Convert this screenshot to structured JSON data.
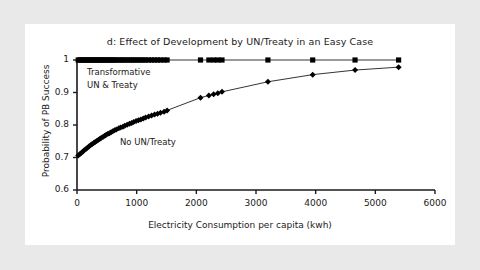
{
  "figure": {
    "background_color": "#e9e9e9",
    "panel_color": "#ffffff",
    "ink_color": "#1a1a1a"
  },
  "chart_data": {
    "type": "line",
    "title": "d: Effect of Development by UN/Treaty in an Easy Case",
    "xlabel": "Electricity Consumption per capita (kwh)",
    "ylabel": "Probability of PB Success",
    "xlim": [
      0,
      6000
    ],
    "ylim": [
      0.6,
      1.0
    ],
    "xticks": [
      0,
      1000,
      2000,
      3000,
      4000,
      5000,
      6000
    ],
    "xtick_labels": [
      "0",
      "1000",
      "2000",
      "3000",
      "4000",
      "5000",
      "6000"
    ],
    "yticks": [
      0.6,
      0.7,
      0.8,
      0.9,
      1.0
    ],
    "ytick_labels": [
      "0.6",
      "0.7",
      "0.8",
      "0.9",
      "1"
    ],
    "grid": false,
    "legend_position": "inline-annotations",
    "annotations": [
      {
        "text": "Transformative",
        "x": 260,
        "y": 0.955
      },
      {
        "text": "UN & Treaty",
        "x": 260,
        "y": 0.915
      },
      {
        "text": "No UN/Treaty",
        "x": 1430,
        "y": 0.735
      }
    ],
    "series": [
      {
        "name": "Transformative UN & Treaty",
        "marker": "square",
        "color": "#000000",
        "points": [
          [
            20,
            1.0
          ],
          [
            45,
            1.0
          ],
          [
            70,
            1.0
          ],
          [
            95,
            1.0
          ],
          [
            120,
            1.0
          ],
          [
            150,
            1.0
          ],
          [
            175,
            1.0
          ],
          [
            200,
            1.0
          ],
          [
            225,
            1.0
          ],
          [
            250,
            1.0
          ],
          [
            280,
            1.0
          ],
          [
            305,
            1.0
          ],
          [
            330,
            1.0
          ],
          [
            360,
            1.0
          ],
          [
            385,
            1.0
          ],
          [
            410,
            1.0
          ],
          [
            440,
            1.0
          ],
          [
            465,
            1.0
          ],
          [
            490,
            1.0
          ],
          [
            520,
            1.0
          ],
          [
            545,
            1.0
          ],
          [
            570,
            1.0
          ],
          [
            600,
            1.0
          ],
          [
            630,
            1.0
          ],
          [
            660,
            1.0
          ],
          [
            700,
            1.0
          ],
          [
            730,
            1.0
          ],
          [
            770,
            1.0
          ],
          [
            800,
            1.0
          ],
          [
            840,
            1.0
          ],
          [
            880,
            1.0
          ],
          [
            915,
            1.0
          ],
          [
            950,
            1.0
          ],
          [
            990,
            1.0
          ],
          [
            1030,
            1.0
          ],
          [
            1070,
            1.0
          ],
          [
            1110,
            1.0
          ],
          [
            1150,
            1.0
          ],
          [
            1200,
            1.0
          ],
          [
            1250,
            1.0
          ],
          [
            1300,
            1.0
          ],
          [
            1350,
            1.0
          ],
          [
            1400,
            1.0
          ],
          [
            1460,
            1.0
          ],
          [
            1510,
            1.0
          ],
          [
            2070,
            1.0
          ],
          [
            2210,
            1.0
          ],
          [
            2290,
            1.0
          ],
          [
            2360,
            1.0
          ],
          [
            2430,
            1.0
          ],
          [
            3200,
            1.0
          ],
          [
            3950,
            1.0
          ],
          [
            4660,
            1.0
          ],
          [
            5390,
            1.0
          ]
        ]
      },
      {
        "name": "No UN/Treaty",
        "marker": "diamond",
        "color": "#000000",
        "points": [
          [
            20,
            0.706
          ],
          [
            45,
            0.71
          ],
          [
            70,
            0.714
          ],
          [
            95,
            0.718
          ],
          [
            120,
            0.722
          ],
          [
            150,
            0.726
          ],
          [
            175,
            0.73
          ],
          [
            200,
            0.734
          ],
          [
            225,
            0.738
          ],
          [
            250,
            0.741
          ],
          [
            280,
            0.745
          ],
          [
            305,
            0.748
          ],
          [
            330,
            0.751
          ],
          [
            360,
            0.755
          ],
          [
            385,
            0.758
          ],
          [
            410,
            0.761
          ],
          [
            440,
            0.764
          ],
          [
            465,
            0.767
          ],
          [
            490,
            0.77
          ],
          [
            520,
            0.773
          ],
          [
            545,
            0.775
          ],
          [
            570,
            0.778
          ],
          [
            600,
            0.781
          ],
          [
            630,
            0.784
          ],
          [
            660,
            0.786
          ],
          [
            700,
            0.79
          ],
          [
            730,
            0.792
          ],
          [
            770,
            0.795
          ],
          [
            800,
            0.798
          ],
          [
            840,
            0.801
          ],
          [
            880,
            0.804
          ],
          [
            915,
            0.806
          ],
          [
            950,
            0.809
          ],
          [
            990,
            0.812
          ],
          [
            1030,
            0.815
          ],
          [
            1070,
            0.817
          ],
          [
            1110,
            0.82
          ],
          [
            1150,
            0.823
          ],
          [
            1200,
            0.826
          ],
          [
            1250,
            0.829
          ],
          [
            1300,
            0.832
          ],
          [
            1350,
            0.835
          ],
          [
            1400,
            0.838
          ],
          [
            1460,
            0.841
          ],
          [
            1510,
            0.845
          ],
          [
            2070,
            0.884
          ],
          [
            2210,
            0.891
          ],
          [
            2290,
            0.895
          ],
          [
            2360,
            0.898
          ],
          [
            2430,
            0.902
          ],
          [
            3200,
            0.933
          ],
          [
            3950,
            0.955
          ],
          [
            4660,
            0.969
          ],
          [
            5390,
            0.978
          ]
        ]
      }
    ]
  }
}
